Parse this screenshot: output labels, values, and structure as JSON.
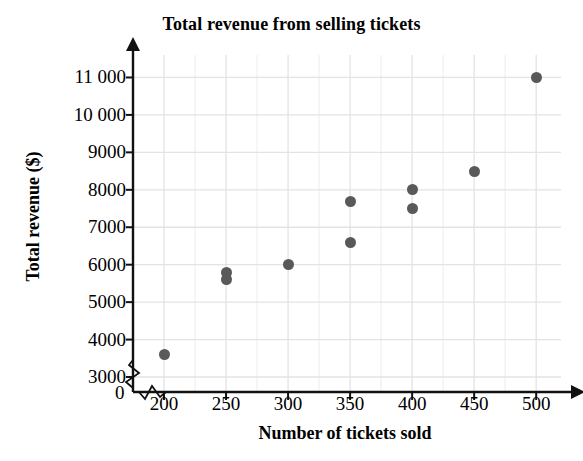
{
  "chart_data": {
    "type": "scatter",
    "title": "Total revenue from selling tickets",
    "xlabel": "Number of tickets sold",
    "ylabel": "Total revenue ($)",
    "origin_label": "0",
    "xlim": [
      175,
      520
    ],
    "ylim": [
      2600,
      11600
    ],
    "xticks": [
      200,
      250,
      300,
      350,
      400,
      450,
      500
    ],
    "xtick_labels": [
      "200",
      "250",
      "300",
      "350",
      "400",
      "450",
      "500"
    ],
    "yticks": [
      3000,
      4000,
      5000,
      6000,
      7000,
      8000,
      9000,
      10000,
      11000
    ],
    "ytick_labels": [
      "3000",
      "4000",
      "5000",
      "6000",
      "7000",
      "8000",
      "9000",
      "10 000",
      "11 000"
    ],
    "grid": true,
    "grid_color": "#e3e3e6",
    "axis_break_x": true,
    "axis_break_y": true,
    "legend": null,
    "point_color": "#595959",
    "points": [
      {
        "x": 200,
        "y": 3600
      },
      {
        "x": 250,
        "y": 5600
      },
      {
        "x": 250,
        "y": 5800
      },
      {
        "x": 300,
        "y": 6000
      },
      {
        "x": 350,
        "y": 6600
      },
      {
        "x": 350,
        "y": 7700
      },
      {
        "x": 400,
        "y": 7500
      },
      {
        "x": 400,
        "y": 8000
      },
      {
        "x": 450,
        "y": 8500
      },
      {
        "x": 500,
        "y": 11000
      }
    ]
  }
}
